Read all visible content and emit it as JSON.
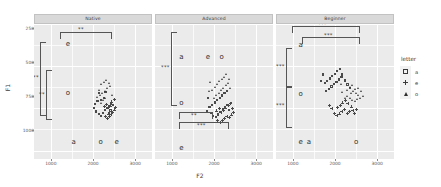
{
  "chart_data": {
    "type": "scatter",
    "title": "",
    "xlabel": "F2",
    "ylabel": "F1",
    "xlim": [
      600,
      3400
    ],
    "ylim": [
      1000,
      200
    ],
    "y_reversed": true,
    "grid": true,
    "legend_position": "right",
    "xticks": [
      "1000",
      "2000",
      "3000"
    ],
    "xtick_values": [
      1000,
      2000,
      3000
    ],
    "yticks": [
      "250",
      "500",
      "750",
      "1000"
    ],
    "ytick_values": [
      250,
      500,
      750,
      1000
    ],
    "legend": {
      "title": "letter",
      "entries": [
        {
          "label": "a",
          "marker": "square-open"
        },
        {
          "label": "e",
          "marker": "plus"
        },
        {
          "label": "o",
          "marker": "triangle-filled"
        }
      ]
    },
    "facets": [
      {
        "name": "Native",
        "label": "Native",
        "annotations": {
          "letters": [
            {
              "text": "a",
              "x": 1540,
              "y": 300
            },
            {
              "text": "o",
              "x": 2180,
              "y": 300
            },
            {
              "text": "e",
              "x": 2560,
              "y": 300
            },
            {
              "text": "o",
              "x": 1400,
              "y": 590
            },
            {
              "text": "e",
              "x": 1400,
              "y": 880
            }
          ],
          "brackets": [
            {
              "orient": "horizontal",
              "stars": "**",
              "from": "a",
              "to": "e"
            },
            {
              "orient": "vertical",
              "stars": "**",
              "from": "a",
              "to": "e"
            },
            {
              "orient": "vertical",
              "stars": "**",
              "from": "o",
              "to": "e"
            }
          ]
        },
        "series": [
          {
            "name": "a",
            "marker": "square-open",
            "points": [
              [
                2072,
                480
              ],
              [
                2142,
                465
              ],
              [
                2190,
                455
              ],
              [
                2236,
                470
              ],
              [
                2292,
                487
              ],
              [
                2340,
                500
              ],
              [
                2386,
                511
              ],
              [
                2430,
                528
              ],
              [
                2060,
                523
              ],
              [
                2112,
                541
              ],
              [
                2196,
                550
              ],
              [
                2258,
                560
              ],
              [
                2150,
                588
              ],
              [
                2300,
                596
              ],
              [
                2380,
                470
              ],
              [
                2420,
                486
              ],
              [
                2028,
                500
              ],
              [
                2480,
                520
              ]
            ]
          },
          {
            "name": "e",
            "marker": "plus",
            "points": [
              [
                2280,
                455
              ],
              [
                2330,
                444
              ],
              [
                2388,
                452
              ],
              [
                2420,
                465
              ],
              [
                2460,
                478
              ],
              [
                2500,
                492
              ],
              [
                2352,
                505
              ],
              [
                2404,
                516
              ],
              [
                2260,
                512
              ],
              [
                2318,
                527
              ],
              [
                2440,
                540
              ],
              [
                2500,
                552
              ],
              [
                2364,
                468
              ],
              [
                2536,
                505
              ]
            ]
          },
          {
            "name": "o",
            "marker": "triangle-filled",
            "points": [
              [
                2186,
                530
              ],
              [
                2240,
                546
              ],
              [
                2294,
                560
              ],
              [
                2176,
                578
              ],
              [
                2228,
                592
              ],
              [
                2282,
                604
              ],
              [
                2340,
                618
              ],
              [
                2140,
                610
              ],
              [
                2204,
                640
              ],
              [
                2260,
                655
              ],
              [
                2318,
                668
              ],
              [
                2380,
                648
              ],
              [
                2416,
                630
              ],
              [
                2110,
                566
              ],
              [
                2452,
                576
              ]
            ]
          }
        ]
      },
      {
        "name": "Advanced",
        "label": "Advanced",
        "annotations": {
          "letters": [
            {
              "text": "e",
              "x": 1220,
              "y": 265
            },
            {
              "text": "o",
              "x": 1220,
              "y": 530
            },
            {
              "text": "a",
              "x": 1220,
              "y": 800
            },
            {
              "text": "e",
              "x": 1850,
              "y": 800
            },
            {
              "text": "o",
              "x": 2180,
              "y": 800
            }
          ],
          "brackets": [
            {
              "orient": "vertical",
              "stars": "***",
              "from": "e",
              "to": "a"
            },
            {
              "orient": "horizontal",
              "stars": "**",
              "from": "a",
              "to": "e"
            },
            {
              "orient": "horizontal",
              "stars": "***",
              "from": "a",
              "to": "o"
            }
          ]
        },
        "series": [
          {
            "name": "a",
            "marker": "square-open",
            "points": [
              [
                1930,
                470
              ],
              [
                1990,
                455
              ],
              [
                2048,
                448
              ],
              [
                2104,
                462
              ],
              [
                2160,
                478
              ],
              [
                2214,
                492
              ],
              [
                2268,
                508
              ],
              [
                2320,
                520
              ],
              [
                1900,
                505
              ],
              [
                1960,
                520
              ],
              [
                2020,
                534
              ],
              [
                2080,
                548
              ],
              [
                2140,
                560
              ],
              [
                2200,
                575
              ],
              [
                2256,
                588
              ],
              [
                1868,
                560
              ],
              [
                2312,
                600
              ],
              [
                2370,
                488
              ],
              [
                2400,
                530
              ],
              [
                1840,
                480
              ]
            ]
          },
          {
            "name": "e",
            "marker": "plus",
            "points": [
              [
                2080,
                430
              ],
              [
                2140,
                418
              ],
              [
                2196,
                428
              ],
              [
                2250,
                442
              ],
              [
                2300,
                456
              ],
              [
                2356,
                448
              ],
              [
                2404,
                462
              ],
              [
                2160,
                476
              ],
              [
                2216,
                490
              ],
              [
                2272,
                504
              ],
              [
                2330,
                518
              ],
              [
                2388,
                532
              ],
              [
                2120,
                500
              ],
              [
                2060,
                486
              ],
              [
                2430,
                500
              ],
              [
                2450,
                475
              ]
            ]
          },
          {
            "name": "o",
            "marker": "triangle-filled",
            "points": [
              [
                2000,
                560
              ],
              [
                2060,
                578
              ],
              [
                2118,
                592
              ],
              [
                2174,
                606
              ],
              [
                2228,
                620
              ],
              [
                2284,
                634
              ],
              [
                2340,
                648
              ],
              [
                1960,
                610
              ],
              [
                2020,
                626
              ],
              [
                2078,
                642
              ],
              [
                2134,
                658
              ],
              [
                2190,
                672
              ],
              [
                2248,
                686
              ],
              [
                1920,
                654
              ],
              [
                2300,
                700
              ],
              [
                2360,
                672
              ],
              [
                1880,
                600
              ],
              [
                2396,
                618
              ]
            ]
          }
        ]
      },
      {
        "name": "Beginner",
        "label": "Beginner",
        "annotations": {
          "letters": [
            {
              "text": "e",
              "x": 1180,
              "y": 300
            },
            {
              "text": "a",
              "x": 1380,
              "y": 300
            },
            {
              "text": "o",
              "x": 2500,
              "y": 300
            },
            {
              "text": "o",
              "x": 1180,
              "y": 580
            },
            {
              "text": "a",
              "x": 1180,
              "y": 870
            }
          ],
          "brackets": [
            {
              "orient": "horizontal",
              "stars": "***",
              "from": "e",
              "to": "o"
            },
            {
              "orient": "horizontal",
              "stars": "***",
              "from": "a",
              "to": "o"
            },
            {
              "orient": "vertical",
              "stars": "***",
              "from": "e",
              "to": "o"
            },
            {
              "orient": "vertical",
              "stars": "***",
              "from": "o",
              "to": "a"
            }
          ]
        },
        "series": [
          {
            "name": "a",
            "marker": "square-open",
            "points": [
              [
                1800,
                600
              ],
              [
                1860,
                614
              ],
              [
                1920,
                628
              ],
              [
                1980,
                642
              ],
              [
                2040,
                656
              ],
              [
                2100,
                670
              ],
              [
                2160,
                684
              ],
              [
                1760,
                648
              ],
              [
                1820,
                662
              ],
              [
                1880,
                676
              ],
              [
                1940,
                690
              ],
              [
                2000,
                704
              ],
              [
                2060,
                718
              ],
              [
                1720,
                700
              ],
              [
                2120,
                732
              ],
              [
                2180,
                700
              ],
              [
                2240,
                664
              ],
              [
                2300,
                640
              ],
              [
                1680,
                660
              ],
              [
                2360,
                620
              ]
            ]
          },
          {
            "name": "e",
            "marker": "plus",
            "points": [
              [
                1980,
                470
              ],
              [
                2040,
                458
              ],
              [
                2100,
                468
              ],
              [
                2160,
                482
              ],
              [
                2220,
                494
              ],
              [
                2280,
                470
              ],
              [
                2340,
                484
              ],
              [
                2060,
                506
              ],
              [
                2120,
                520
              ],
              [
                2180,
                534
              ],
              [
                2240,
                548
              ],
              [
                2300,
                530
              ],
              [
                1920,
                500
              ],
              [
                2380,
                510
              ],
              [
                2420,
                488
              ],
              [
                1860,
                520
              ],
              [
                2460,
                470
              ],
              [
                2500,
                496
              ]
            ]
          },
          {
            "name": "o",
            "marker": "triangle-filled",
            "points": [
              [
                2240,
                560
              ],
              [
                2300,
                574
              ],
              [
                2360,
                560
              ],
              [
                2420,
                548
              ],
              [
                2480,
                540
              ],
              [
                2540,
                552
              ],
              [
                2380,
                588
              ],
              [
                2440,
                600
              ],
              [
                2500,
                590
              ],
              [
                2560,
                578
              ],
              [
                2600,
                560
              ],
              [
                2300,
                610
              ],
              [
                2360,
                624
              ],
              [
                2420,
                636
              ],
              [
                2180,
                596
              ],
              [
                2620,
                600
              ],
              [
                2660,
                572
              ],
              [
                2140,
                640
              ],
              [
                2560,
                620
              ],
              [
                2480,
                612
              ]
            ]
          }
        ]
      }
    ]
  }
}
